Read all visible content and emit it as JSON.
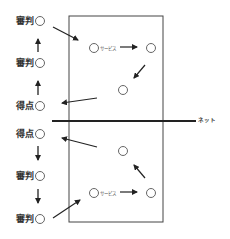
{
  "diagram": {
    "type": "volleyball-rotation",
    "colors": {
      "line": "#444444",
      "circle": "#555555",
      "text": "#333333"
    },
    "net_label": "ネット",
    "serve_label_top": "サービス",
    "serve_label_bottom": "サービス",
    "side_top": [
      {
        "label": "審判",
        "role": "referee"
      },
      {
        "label": "審判",
        "role": "referee"
      },
      {
        "label": "得点",
        "role": "scorer"
      }
    ],
    "side_bottom": [
      {
        "label": "得点",
        "role": "scorer"
      },
      {
        "label": "審判",
        "role": "referee"
      },
      {
        "label": "審判",
        "role": "referee"
      }
    ]
  }
}
